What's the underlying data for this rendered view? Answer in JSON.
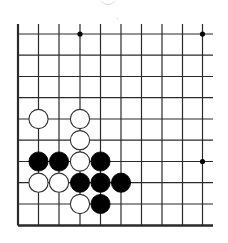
{
  "board": {
    "description": "Go board fragment (bottom-left corner region)",
    "columns_x": [
      18,
      38.5,
      59,
      80,
      100.5,
      121,
      141.5,
      162,
      182.5,
      202.5
    ],
    "rows_y": [
      34,
      55.2,
      76.5,
      97.7,
      119,
      140.2,
      161.5,
      182.7,
      204,
      225.5
    ],
    "vertical_line_top": 24,
    "horizontal_line_right": 213,
    "left_edge_thick": true,
    "bottom_edge_thick": true,
    "line_color": "#2a2a2a",
    "star_points": [
      {
        "col": 3,
        "row": 0
      },
      {
        "col": 9,
        "row": 0
      },
      {
        "col": 9,
        "row": 6
      },
      {
        "col": 3,
        "row": 6
      }
    ],
    "stones": [
      {
        "color": "white",
        "col": 1,
        "row": 4
      },
      {
        "color": "white",
        "col": 3,
        "row": 4
      },
      {
        "color": "white",
        "col": 3,
        "row": 5
      },
      {
        "color": "black",
        "col": 1,
        "row": 6
      },
      {
        "color": "black",
        "col": 2,
        "row": 6
      },
      {
        "color": "white",
        "col": 3,
        "row": 6
      },
      {
        "color": "black",
        "col": 4,
        "row": 6
      },
      {
        "color": "white",
        "col": 1,
        "row": 7
      },
      {
        "color": "white",
        "col": 2,
        "row": 7
      },
      {
        "color": "black",
        "col": 3,
        "row": 7
      },
      {
        "color": "black",
        "col": 4,
        "row": 7
      },
      {
        "color": "black",
        "col": 5,
        "row": 7
      },
      {
        "color": "white",
        "col": 3,
        "row": 8
      },
      {
        "color": "black",
        "col": 4,
        "row": 8
      }
    ],
    "stone_colors": {
      "black": "#000000",
      "white": "#ffffff",
      "white_outline": "#333333"
    }
  }
}
